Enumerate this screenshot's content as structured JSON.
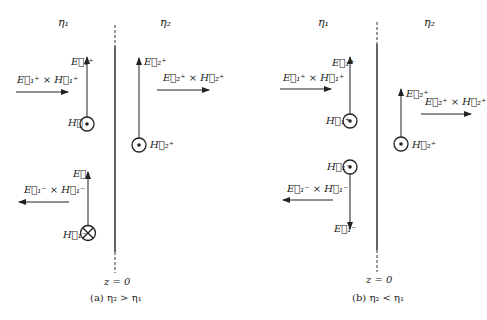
{
  "panels": [
    {
      "id": "a",
      "media_left": "η₁",
      "media_right": "η₂",
      "boundary_label": "z = 0",
      "caption": "(a)  η₂ > η₁",
      "labels": {
        "E1_plus": "E⃗₁⁺",
        "S1_plus": "E⃗₁⁺ × H⃗₁⁺",
        "H1_plus": "H⃗",
        "E2_plus": "E⃗₂⁺",
        "S2_plus": "E⃗₂⁺ × H⃗₂⁺",
        "H2_plus": "H⃗₂⁺",
        "E1_minus": "E⃗₁",
        "S1_minus": "E⃗₁⁻ × H⃗₁⁻",
        "H1_minus": "H⃗₁⁻"
      }
    },
    {
      "id": "b",
      "media_left": "η₁",
      "media_right": "η₂",
      "boundary_label": "z = 0",
      "caption": "(b)  η₂ < η₁",
      "labels": {
        "E1_plus": "E⃗₁⁺",
        "S1_plus": "E⃗₁⁺ × H⃗₁⁺",
        "H1_plus": "H⃗₁⁺",
        "E2_plus": "E⃗₂⁺",
        "S2_plus": "E⃗₂⁺ × H⃗₂⁺",
        "H2_plus": "H⃗₂⁺",
        "H1_minus": "H⃗₁⁻",
        "S1_minus": "E⃗₁⁻ × H⃗₁⁻",
        "E1_minus": "E⃗₁⁻"
      }
    }
  ],
  "colors": {
    "ink": "#222222",
    "background": "#ffffff"
  }
}
